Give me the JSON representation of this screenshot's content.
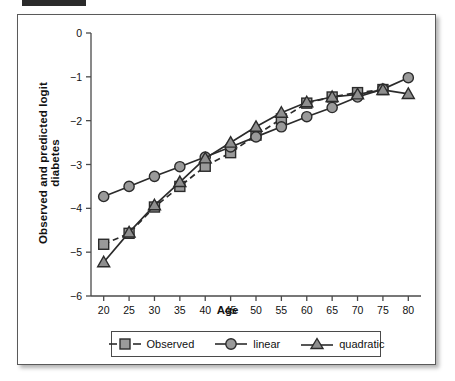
{
  "figure": {
    "background": "#ffffff",
    "frame_color": "#5a5a5a"
  },
  "chart_data": {
    "type": "line",
    "title": "",
    "xlabel": "Age",
    "ylabel": "Observed and predicted logit diabetes",
    "x": [
      20,
      25,
      30,
      35,
      40,
      45,
      50,
      55,
      60,
      65,
      70,
      75,
      80
    ],
    "xlim": [
      17.5,
      82.5
    ],
    "ylim": [
      -6,
      0
    ],
    "xticks": [
      20,
      25,
      30,
      35,
      40,
      45,
      50,
      55,
      60,
      65,
      70,
      75,
      80
    ],
    "xticklabels": [
      "20",
      "25",
      "30",
      "35",
      "40",
      "45",
      "50",
      "55",
      "60",
      "65",
      "70",
      "75",
      "80"
    ],
    "yticks": [
      0,
      -1,
      -2,
      -3,
      -4,
      -5,
      -6
    ],
    "yticklabels": [
      "0",
      "−1",
      "−2",
      "−3",
      "−4",
      "−5",
      "−6"
    ],
    "grid": false,
    "legend_position": "below-axes",
    "series": [
      {
        "name": "Observed",
        "marker": "square",
        "linestyle": "dashed",
        "color": "#2b2b2b",
        "marker_fill": "#9a9a9a",
        "x": [
          20,
          25,
          30,
          35,
          40,
          45,
          50,
          55,
          60,
          65,
          70,
          75
        ],
        "values": [
          -4.82,
          -4.57,
          -3.97,
          -3.5,
          -3.04,
          -2.73,
          -2.33,
          -1.96,
          -1.6,
          -1.46,
          -1.36,
          -1.29
        ]
      },
      {
        "name": "linear",
        "marker": "circle",
        "linestyle": "solid",
        "color": "#2b2b2b",
        "marker_fill": "#9a9a9a",
        "x": [
          20,
          25,
          30,
          35,
          40,
          45,
          50,
          55,
          60,
          65,
          70,
          75,
          80
        ],
        "values": [
          -3.73,
          -3.5,
          -3.27,
          -3.05,
          -2.83,
          -2.6,
          -2.37,
          -2.14,
          -1.91,
          -1.7,
          -1.46,
          -1.28,
          -1.02
        ]
      },
      {
        "name": "quadratic",
        "marker": "triangle",
        "linestyle": "solid",
        "color": "#2b2b2b",
        "marker_fill": "#8e8e8e",
        "x": [
          20,
          25,
          30,
          35,
          40,
          45,
          50,
          55,
          60,
          65,
          70,
          75,
          80
        ],
        "values": [
          -5.23,
          -4.55,
          -3.93,
          -3.4,
          -2.86,
          -2.5,
          -2.14,
          -1.82,
          -1.58,
          -1.46,
          -1.4,
          -1.3,
          -1.39
        ]
      }
    ]
  },
  "legend": {
    "items": [
      {
        "label": "Observed",
        "marker": "square",
        "linestyle": "dashed"
      },
      {
        "label": "linear",
        "marker": "circle",
        "linestyle": "solid"
      },
      {
        "label": "quadratic",
        "marker": "triangle",
        "linestyle": "solid"
      }
    ]
  }
}
